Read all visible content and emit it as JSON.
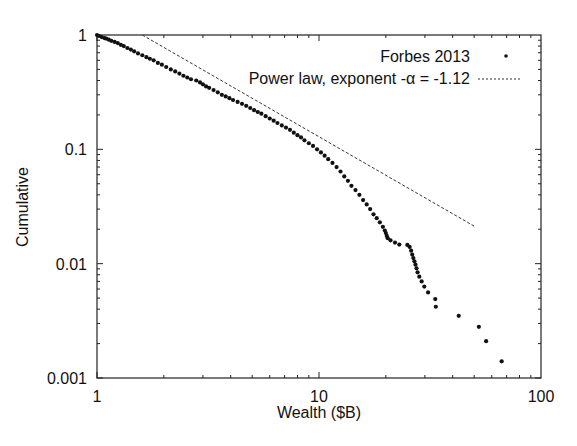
{
  "chart_data": {
    "type": "scatter",
    "title": "",
    "xlabel": "Wealth ($B)",
    "ylabel": "Cumulative",
    "xscale": "log",
    "yscale": "log",
    "xlim": [
      1,
      100
    ],
    "ylim": [
      0.001,
      1
    ],
    "xticks": [
      {
        "value": 1,
        "label": "1"
      },
      {
        "value": 10,
        "label": "10"
      },
      {
        "value": 100,
        "label": "100"
      }
    ],
    "yticks": [
      {
        "value": 0.001,
        "label": "0.001"
      },
      {
        "value": 0.01,
        "label": "0.01"
      },
      {
        "value": 0.1,
        "label": "0.1"
      },
      {
        "value": 1,
        "label": "1"
      }
    ],
    "grid": false,
    "legend_position": "top-right",
    "series": [
      {
        "name": "Forbes 2013",
        "type": "scatter",
        "marker": "dot",
        "color": "#111111",
        "points": [
          [
            1.0,
            1.0
          ],
          [
            1.02,
            0.98
          ],
          [
            1.05,
            0.96
          ],
          [
            1.08,
            0.94
          ],
          [
            1.1,
            0.93
          ],
          [
            1.13,
            0.91
          ],
          [
            1.16,
            0.89
          ],
          [
            1.2,
            0.87
          ],
          [
            1.24,
            0.85
          ],
          [
            1.28,
            0.82
          ],
          [
            1.32,
            0.8
          ],
          [
            1.37,
            0.77
          ],
          [
            1.42,
            0.745
          ],
          [
            1.47,
            0.72
          ],
          [
            1.53,
            0.69
          ],
          [
            1.6,
            0.665
          ],
          [
            1.67,
            0.64
          ],
          [
            1.73,
            0.62
          ],
          [
            1.8,
            0.6
          ],
          [
            1.88,
            0.57
          ],
          [
            1.96,
            0.55
          ],
          [
            2.05,
            0.525
          ],
          [
            2.15,
            0.5
          ],
          [
            2.25,
            0.48
          ],
          [
            2.35,
            0.46
          ],
          [
            2.45,
            0.44
          ],
          [
            2.55,
            0.425
          ],
          [
            2.65,
            0.41
          ],
          [
            2.8,
            0.4
          ],
          [
            2.91,
            0.385
          ],
          [
            3.0,
            0.37
          ],
          [
            3.1,
            0.355
          ],
          [
            3.2,
            0.345
          ],
          [
            3.35,
            0.33
          ],
          [
            3.5,
            0.315
          ],
          [
            3.65,
            0.3
          ],
          [
            3.8,
            0.29
          ],
          [
            3.95,
            0.28
          ],
          [
            4.1,
            0.27
          ],
          [
            4.3,
            0.26
          ],
          [
            4.5,
            0.25
          ],
          [
            4.7,
            0.24
          ],
          [
            4.9,
            0.23
          ],
          [
            5.1,
            0.22
          ],
          [
            5.3,
            0.212
          ],
          [
            5.5,
            0.205
          ],
          [
            5.75,
            0.195
          ],
          [
            6.0,
            0.186
          ],
          [
            6.25,
            0.178
          ],
          [
            6.5,
            0.17
          ],
          [
            6.8,
            0.162
          ],
          [
            7.1,
            0.155
          ],
          [
            7.4,
            0.148
          ],
          [
            7.7,
            0.14
          ],
          [
            8.0,
            0.133
          ],
          [
            8.3,
            0.127
          ],
          [
            8.6,
            0.12
          ],
          [
            9.0,
            0.113
          ],
          [
            9.4,
            0.107
          ],
          [
            9.8,
            0.1
          ],
          [
            10.2,
            0.094
          ],
          [
            10.6,
            0.088
          ],
          [
            11.0,
            0.082
          ],
          [
            11.5,
            0.076
          ],
          [
            12.0,
            0.07
          ],
          [
            12.5,
            0.064
          ],
          [
            13.0,
            0.058
          ],
          [
            13.5,
            0.053
          ],
          [
            14.0,
            0.048
          ],
          [
            14.6,
            0.044
          ],
          [
            15.2,
            0.04
          ],
          [
            15.8,
            0.036
          ],
          [
            16.4,
            0.033
          ],
          [
            17.0,
            0.03
          ],
          [
            17.6,
            0.027
          ],
          [
            18.2,
            0.025
          ],
          [
            18.8,
            0.023
          ],
          [
            19.4,
            0.021
          ],
          [
            19.8,
            0.0195
          ],
          [
            20.0,
            0.0185
          ],
          [
            20.2,
            0.0175
          ],
          [
            20.4,
            0.0167
          ],
          [
            21.0,
            0.016
          ],
          [
            22.0,
            0.0153
          ],
          [
            23.0,
            0.0147
          ],
          [
            25.0,
            0.0146
          ],
          [
            25.6,
            0.014
          ],
          [
            26.0,
            0.013
          ],
          [
            26.3,
            0.012
          ],
          [
            26.6,
            0.0112
          ],
          [
            26.9,
            0.0105
          ],
          [
            27.2,
            0.0098
          ],
          [
            27.5,
            0.0091
          ],
          [
            27.8,
            0.0084
          ],
          [
            28.3,
            0.0077
          ],
          [
            29.0,
            0.007
          ],
          [
            29.8,
            0.0063
          ],
          [
            31.0,
            0.0056
          ],
          [
            33.4,
            0.0049
          ],
          [
            33.6,
            0.0042
          ],
          [
            42.6,
            0.0035
          ],
          [
            52.5,
            0.0028
          ],
          [
            56.6,
            0.0021
          ],
          [
            66.5,
            0.0014
          ]
        ]
      },
      {
        "name": "Power law, exponent -α = -1.12",
        "type": "line",
        "style": "dashed",
        "color": "#333333",
        "exponent": -1.12,
        "x": [
          1.6,
          50
        ],
        "y": [
          1.0,
          0.0213
        ]
      }
    ],
    "legend": [
      {
        "label": "Forbes 2013",
        "marker": "dot"
      },
      {
        "label": "Power law, exponent -α = -1.12",
        "marker": "dashed-line"
      }
    ]
  }
}
